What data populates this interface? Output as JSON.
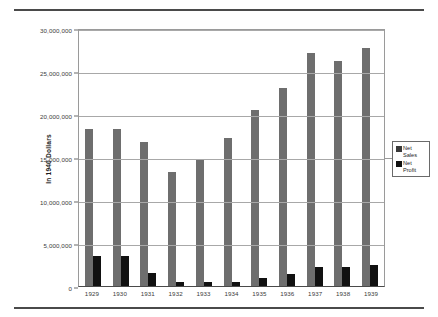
{
  "chart_data": {
    "type": "bar",
    "title": "",
    "xlabel": "",
    "ylabel": "In 1940 Dollars",
    "ylim": [
      0,
      30000000
    ],
    "ytick_values": [
      30000000,
      25000000,
      20000000,
      15000000,
      10000000,
      5000000,
      0
    ],
    "ytick_labels": [
      "30,000,000",
      "25,000,000",
      "20,000,000",
      "15,000,000",
      "10,000,000",
      "5,000,000",
      "0"
    ],
    "grid": true,
    "legend_position": "right",
    "categories": [
      "1929",
      "1930",
      "1931",
      "1932",
      "1933",
      "1934",
      "1935",
      "1936",
      "1937",
      "1938",
      "1939"
    ],
    "series": [
      {
        "name": "Net Sales",
        "legend_label": "Net\nSales",
        "color": "#6e6e6e",
        "values": [
          18300000,
          18200000,
          16700000,
          13300000,
          14800000,
          17200000,
          20500000,
          23000000,
          27100000,
          26200000,
          27700000
        ]
      },
      {
        "name": "Net Profit",
        "legend_label": "Net\nProfit",
        "color": "#111111",
        "values": [
          3500000,
          3500000,
          1500000,
          500000,
          500000,
          500000,
          900000,
          1400000,
          2200000,
          2200000,
          2500000
        ]
      }
    ]
  },
  "colors": {
    "net_sales": "#6e6e6e",
    "net_profit": "#111111",
    "gridline": "#a8a8a8",
    "axis": "#4a4a4a",
    "rule": "#4a4a4a"
  }
}
